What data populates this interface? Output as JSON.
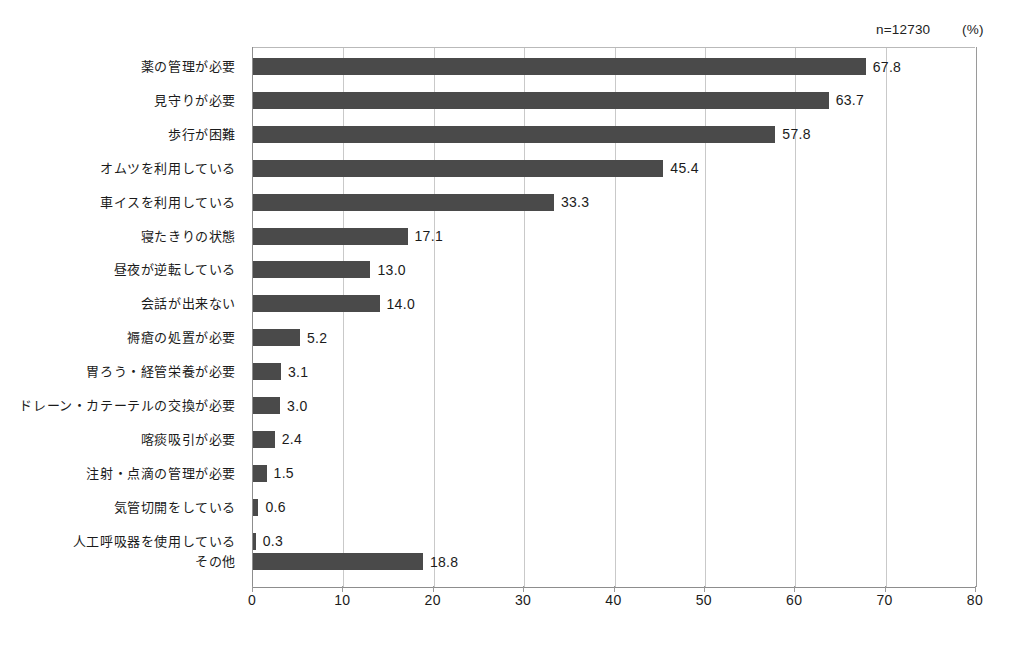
{
  "annotations": {
    "sample_size": "n=12730",
    "unit": "(%)"
  },
  "chart_data": {
    "type": "bar",
    "orientation": "horizontal",
    "title": "",
    "subtitle": "",
    "xlabel": "",
    "ylabel": "",
    "xlim": [
      0,
      80
    ],
    "xticks": [
      0,
      10,
      20,
      30,
      40,
      50,
      60,
      70,
      80
    ],
    "xtick_labels": [
      "0",
      "10",
      "20",
      "30",
      "40",
      "50",
      "60",
      "70",
      "80"
    ],
    "grid": true,
    "grid_axis": "x",
    "legend": false,
    "bar_color": "#4a4a4a",
    "categories": [
      "薬の管理が必要",
      "見守りが必要",
      "歩行が困難",
      "オムツを利用している",
      "車イスを利用している",
      "寝たきりの状態",
      "昼夜が逆転している",
      "会話が出来ない",
      "褥瘡の処置が必要",
      "胃ろう・経管栄養が必要",
      "ドレーン・カテーテルの交換が必要",
      "喀痰吸引が必要",
      "注射・点滴の管理が必要",
      "気管切開をしている",
      "人工呼吸器を使用している",
      "その他"
    ],
    "values": [
      67.8,
      63.7,
      57.8,
      45.4,
      33.3,
      17.1,
      13.0,
      14.0,
      5.2,
      3.1,
      3.0,
      2.4,
      1.5,
      0.6,
      0.3,
      18.8
    ],
    "value_labels": [
      "67.8",
      "63.7",
      "57.8",
      "45.4",
      "33.3",
      "17.1",
      "13.0",
      "14.0",
      "5.2",
      "3.1",
      "3.0",
      "2.4",
      "1.5",
      "0.6",
      "0.3",
      "18.8"
    ]
  }
}
